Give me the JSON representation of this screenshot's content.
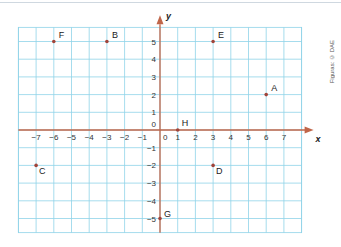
{
  "chart_data": {
    "type": "scatter",
    "title": "",
    "xlabel": "x",
    "ylabel": "y",
    "xlim": [
      -8,
      8
    ],
    "ylim": [
      -5.8,
      5.8
    ],
    "grid": true,
    "x_ticks": [
      -7,
      -6,
      -5,
      -4,
      -3,
      -2,
      -1,
      0,
      1,
      2,
      3,
      4,
      5,
      6,
      7
    ],
    "y_ticks": [
      5,
      4,
      3,
      2,
      1,
      0,
      -1,
      -2,
      -3,
      -4,
      -5
    ],
    "points": [
      {
        "label": "A",
        "x": 6,
        "y": 2
      },
      {
        "label": "B",
        "x": -3,
        "y": 5
      },
      {
        "label": "C",
        "x": -7,
        "y": -2
      },
      {
        "label": "D",
        "x": 3,
        "y": -2
      },
      {
        "label": "E",
        "x": 3,
        "y": 5
      },
      {
        "label": "F",
        "x": -6,
        "y": 5
      },
      {
        "label": "G",
        "x": 0,
        "y": -5
      },
      {
        "label": "H",
        "x": 1,
        "y": 0
      }
    ]
  },
  "credit": "Figuras: © DAE"
}
